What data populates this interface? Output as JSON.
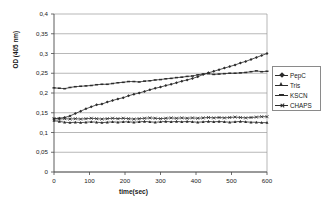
{
  "chart_data": {
    "type": "line",
    "title": "",
    "xlabel": "time(sec)",
    "ylabel": "OD (405 nm)",
    "xlim": [
      0,
      600
    ],
    "ylim": [
      0,
      0.4
    ],
    "xticks": [
      "0",
      "100",
      "200",
      "300",
      "400",
      "500",
      "600"
    ],
    "yticks": [
      "0",
      "0,05",
      "0,1",
      "0,15",
      "0,2",
      "0,25",
      "0,3",
      "0,35",
      "0,4"
    ],
    "ytick_values": [
      0,
      0.05,
      0.1,
      0.15,
      0.2,
      0.25,
      0.3,
      0.35,
      0.4
    ],
    "xtick_values": [
      0,
      100,
      200,
      300,
      400,
      500,
      600
    ],
    "grid": "horizontal",
    "legend_position": "right",
    "decimal_separator": ",",
    "x": [
      0,
      15,
      30,
      45,
      60,
      75,
      90,
      105,
      120,
      135,
      150,
      165,
      180,
      195,
      210,
      225,
      240,
      255,
      270,
      285,
      300,
      315,
      330,
      345,
      360,
      375,
      390,
      405,
      420,
      435,
      450,
      465,
      480,
      495,
      510,
      525,
      540,
      555,
      570,
      585,
      600
    ],
    "series": [
      {
        "name": "PepC",
        "marker": "diamond",
        "values": [
          0.135,
          0.136,
          0.138,
          0.142,
          0.148,
          0.154,
          0.16,
          0.165,
          0.17,
          0.172,
          0.177,
          0.181,
          0.185,
          0.188,
          0.193,
          0.197,
          0.2,
          0.204,
          0.208,
          0.212,
          0.215,
          0.219,
          0.222,
          0.226,
          0.23,
          0.233,
          0.237,
          0.241,
          0.247,
          0.251,
          0.255,
          0.259,
          0.263,
          0.267,
          0.271,
          0.276,
          0.28,
          0.285,
          0.29,
          0.295,
          0.3
        ]
      },
      {
        "name": "Tris",
        "marker": "triangle",
        "values": [
          0.13,
          0.128,
          0.126,
          0.125,
          0.126,
          0.125,
          0.126,
          0.127,
          0.126,
          0.125,
          0.126,
          0.127,
          0.126,
          0.127,
          0.127,
          0.126,
          0.127,
          0.128,
          0.127,
          0.126,
          0.127,
          0.128,
          0.127,
          0.128,
          0.127,
          0.128,
          0.127,
          0.126,
          0.127,
          0.128,
          0.127,
          0.128,
          0.127,
          0.126,
          0.127,
          0.128,
          0.127,
          0.126,
          0.126,
          0.125,
          0.125
        ]
      },
      {
        "name": "KSCN",
        "marker": "dash",
        "values": [
          0.213,
          0.212,
          0.211,
          0.214,
          0.216,
          0.217,
          0.218,
          0.219,
          0.221,
          0.222,
          0.222,
          0.224,
          0.226,
          0.227,
          0.229,
          0.229,
          0.228,
          0.23,
          0.231,
          0.233,
          0.234,
          0.236,
          0.237,
          0.239,
          0.24,
          0.242,
          0.243,
          0.246,
          0.248,
          0.249,
          0.247,
          0.248,
          0.249,
          0.25,
          0.25,
          0.251,
          0.252,
          0.254,
          0.256,
          0.254,
          0.255
        ]
      },
      {
        "name": "CHAPS",
        "marker": "cross",
        "values": [
          0.135,
          0.134,
          0.135,
          0.134,
          0.135,
          0.134,
          0.135,
          0.136,
          0.135,
          0.134,
          0.135,
          0.136,
          0.135,
          0.136,
          0.135,
          0.134,
          0.135,
          0.136,
          0.137,
          0.136,
          0.135,
          0.136,
          0.137,
          0.136,
          0.137,
          0.136,
          0.137,
          0.136,
          0.137,
          0.138,
          0.137,
          0.138,
          0.137,
          0.138,
          0.139,
          0.138,
          0.137,
          0.138,
          0.139,
          0.14,
          0.14
        ]
      }
    ]
  },
  "legend": {
    "items": [
      {
        "label": "PepC"
      },
      {
        "label": "Tris"
      },
      {
        "label": "KSCN"
      },
      {
        "label": "CHAPS"
      }
    ]
  }
}
